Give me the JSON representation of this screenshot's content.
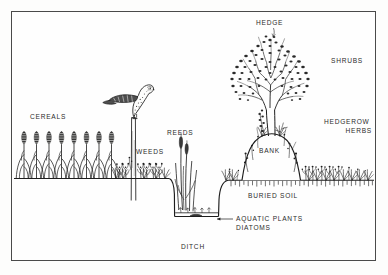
{
  "figure": {
    "type": "scientific-cross-section-diagram",
    "width": 388,
    "height": 275,
    "frame": {
      "stroke": "#4a4a4a",
      "background": "#fefefe"
    },
    "ink_color": "#1d1d1d",
    "background_color": "#ffffff"
  },
  "labels": {
    "cereals": "CEREALS",
    "weeds": "WEEDS",
    "reeds": "REEDS",
    "ditch": "DITCH",
    "aquatic_plants": "AQUATIC PLANTS",
    "diatoms": "DIATOMS",
    "buried_soil": "BURIED  SOIL",
    "bank": "BANK",
    "hedge": "HEDGE",
    "shrubs": "SHRUBS",
    "hedgerow": "HEDGEROW",
    "herbs": "HERBS"
  },
  "zones": [
    {
      "name": "cereal-crop-field",
      "label": "CEREALS",
      "x": 20,
      "y": 115
    },
    {
      "name": "field-weeds",
      "label": "WEEDS",
      "x": 134,
      "y": 150
    },
    {
      "name": "ditch-reeds",
      "label": "REEDS",
      "x": 166,
      "y": 131
    },
    {
      "name": "ditch-channel",
      "label": "DITCH",
      "x": 180,
      "y": 245
    },
    {
      "name": "aquatic-plants",
      "label": "AQUATIC PLANTS",
      "x": 236,
      "y": 219
    },
    {
      "name": "diatoms",
      "label": "DIATOMS",
      "x": 236,
      "y": 228
    },
    {
      "name": "buried-soil-horizon",
      "label": "BURIED  SOIL",
      "x": 246,
      "y": 196
    },
    {
      "name": "earth-bank",
      "label": "BANK",
      "x": 273,
      "y": 150
    },
    {
      "name": "hedge-tree",
      "label": "HEDGE",
      "x": 265,
      "y": 21
    },
    {
      "name": "shrub-layer",
      "label": "SHRUBS",
      "x": 333,
      "y": 59
    },
    {
      "name": "hedgerow-herb-layer",
      "label": "HEDGEROW",
      "x": 330,
      "y": 121
    }
  ],
  "fauna": [
    {
      "name": "perched-raptor",
      "description": "bird of prey perched on fence post",
      "x": 108,
      "y": 78
    }
  ],
  "structures": [
    {
      "name": "fence-post",
      "x": 134,
      "y_top": 117,
      "y_bottom": 200
    }
  ]
}
